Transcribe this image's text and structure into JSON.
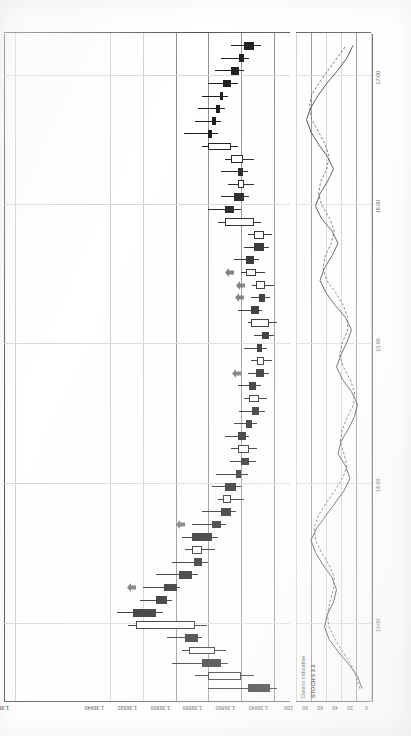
{
  "app": {
    "title": "Forex candlestick chart with stochastic oscillator",
    "notes": {
      "data_disclaimer": "Data is indicative",
      "indicator_label": "STOCH 5 3 3"
    }
  },
  "colors": {
    "bearish_body": "#111111",
    "bullish_body": "#ffffff",
    "outline": "#111111",
    "grid": "#cfcfcf",
    "grid_major": "#8a8a8a",
    "axis": "#555555",
    "signal_arrow": "#6b6b6b",
    "stoch_k": "#222222",
    "stoch_d": "#444444",
    "background": "#ffffff"
  },
  "chart_data": {
    "type": "candlestick",
    "title": "",
    "xlabel": "",
    "ylabel": "",
    "grid": true,
    "legend_position": "none",
    "price_axis": {
      "labels": [
        "1.36998",
        "1.36940",
        "1.36920",
        "1.36900",
        "1.36880",
        "1.36860",
        "1.36840"
      ],
      "values": [
        1.36998,
        1.3694,
        1.3692,
        1.369,
        1.3688,
        1.3686,
        1.3684
      ],
      "ylim": [
        1.3683,
        1.37005
      ]
    },
    "time_axis": {
      "labels": [
        "13:00",
        "14:00",
        "15:00",
        "16:00",
        "17:00"
      ],
      "positions": [
        0.115,
        0.325,
        0.535,
        0.742,
        0.935
      ]
    },
    "candles": [
      {
        "t": "13:00",
        "o": 1.36856,
        "h": 1.3688,
        "l": 1.36838,
        "c": 1.36842,
        "dir": "down"
      },
      {
        "t": "13:05",
        "o": 1.3686,
        "h": 1.36888,
        "l": 1.36852,
        "c": 1.3688,
        "dir": "up"
      },
      {
        "t": "13:10",
        "o": 1.36884,
        "h": 1.36902,
        "l": 1.36868,
        "c": 1.36872,
        "dir": "down"
      },
      {
        "t": "13:15",
        "o": 1.36876,
        "h": 1.36896,
        "l": 1.36869,
        "c": 1.36892,
        "dir": "up"
      },
      {
        "t": "13:20",
        "o": 1.36894,
        "h": 1.36905,
        "l": 1.36884,
        "c": 1.36886,
        "dir": "down"
      },
      {
        "t": "13:25",
        "o": 1.36888,
        "h": 1.36929,
        "l": 1.36881,
        "c": 1.36924,
        "dir": "up"
      },
      {
        "t": "13:30",
        "o": 1.36926,
        "h": 1.36936,
        "l": 1.36908,
        "c": 1.36912,
        "dir": "down"
      },
      {
        "t": "13:35",
        "o": 1.36912,
        "h": 1.36922,
        "l": 1.36902,
        "c": 1.36905,
        "dir": "down"
      },
      {
        "t": "13:40",
        "o": 1.36907,
        "h": 1.3692,
        "l": 1.36897,
        "c": 1.36899,
        "dir": "down",
        "signal": true
      },
      {
        "t": "13:45",
        "o": 1.36898,
        "h": 1.36912,
        "l": 1.36886,
        "c": 1.3689,
        "dir": "down"
      },
      {
        "t": "13:50",
        "o": 1.36889,
        "h": 1.36902,
        "l": 1.3688,
        "c": 1.36884,
        "dir": "down"
      },
      {
        "t": "13:55",
        "o": 1.36884,
        "h": 1.36894,
        "l": 1.36876,
        "c": 1.3689,
        "dir": "up"
      },
      {
        "t": "14:00",
        "o": 1.3689,
        "h": 1.36896,
        "l": 1.36874,
        "c": 1.36878,
        "dir": "down"
      },
      {
        "t": "14:05",
        "o": 1.36878,
        "h": 1.3689,
        "l": 1.36869,
        "c": 1.36872,
        "dir": "down",
        "signal": true
      },
      {
        "t": "14:10",
        "o": 1.36872,
        "h": 1.36884,
        "l": 1.36863,
        "c": 1.36866,
        "dir": "down"
      },
      {
        "t": "14:15",
        "o": 1.36866,
        "h": 1.36874,
        "l": 1.36858,
        "c": 1.36871,
        "dir": "up"
      },
      {
        "t": "14:20",
        "o": 1.3687,
        "h": 1.36878,
        "l": 1.3686,
        "c": 1.36863,
        "dir": "down"
      },
      {
        "t": "14:25",
        "o": 1.36863,
        "h": 1.36875,
        "l": 1.36856,
        "c": 1.3686,
        "dir": "down"
      },
      {
        "t": "14:30",
        "o": 1.3686,
        "h": 1.36867,
        "l": 1.36851,
        "c": 1.36855,
        "dir": "down"
      },
      {
        "t": "14:35",
        "o": 1.36855,
        "h": 1.36866,
        "l": 1.3685,
        "c": 1.36862,
        "dir": "up"
      },
      {
        "t": "14:40",
        "o": 1.36862,
        "h": 1.3687,
        "l": 1.36855,
        "c": 1.36857,
        "dir": "down"
      },
      {
        "t": "14:45",
        "o": 1.36857,
        "h": 1.36864,
        "l": 1.3685,
        "c": 1.36853,
        "dir": "down"
      },
      {
        "t": "14:50",
        "o": 1.36853,
        "h": 1.36861,
        "l": 1.36845,
        "c": 1.36849,
        "dir": "down"
      },
      {
        "t": "14:55",
        "o": 1.36849,
        "h": 1.36858,
        "l": 1.36844,
        "c": 1.36855,
        "dir": "up"
      },
      {
        "t": "15:00",
        "o": 1.36855,
        "h": 1.36862,
        "l": 1.36848,
        "c": 1.36851,
        "dir": "down"
      },
      {
        "t": "15:05",
        "o": 1.36851,
        "h": 1.36856,
        "l": 1.36843,
        "c": 1.36846,
        "dir": "down",
        "signal": true
      },
      {
        "t": "15:10",
        "o": 1.36846,
        "h": 1.36854,
        "l": 1.36841,
        "c": 1.3685,
        "dir": "up"
      },
      {
        "t": "15:15",
        "o": 1.3685,
        "h": 1.36858,
        "l": 1.36844,
        "c": 1.36847,
        "dir": "down"
      },
      {
        "t": "15:20",
        "o": 1.36847,
        "h": 1.36852,
        "l": 1.3684,
        "c": 1.36843,
        "dir": "down"
      },
      {
        "t": "15:25",
        "o": 1.36843,
        "h": 1.36856,
        "l": 1.36838,
        "c": 1.36854,
        "dir": "up"
      },
      {
        "t": "15:30",
        "o": 1.36854,
        "h": 1.36862,
        "l": 1.36847,
        "c": 1.36849,
        "dir": "down"
      },
      {
        "t": "15:35",
        "o": 1.36849,
        "h": 1.36854,
        "l": 1.36842,
        "c": 1.36845,
        "dir": "down",
        "signal": true
      },
      {
        "t": "15:40",
        "o": 1.36845,
        "h": 1.36853,
        "l": 1.3684,
        "c": 1.36851,
        "dir": "up",
        "signal": true
      },
      {
        "t": "15:45",
        "o": 1.36851,
        "h": 1.3686,
        "l": 1.36845,
        "c": 1.36857,
        "dir": "up",
        "signal": true
      },
      {
        "t": "15:50",
        "o": 1.36857,
        "h": 1.36864,
        "l": 1.36849,
        "c": 1.36852,
        "dir": "down"
      },
      {
        "t": "15:55",
        "o": 1.36852,
        "h": 1.36858,
        "l": 1.36843,
        "c": 1.36846,
        "dir": "down"
      },
      {
        "t": "16:00",
        "o": 1.36846,
        "h": 1.36856,
        "l": 1.36841,
        "c": 1.36852,
        "dir": "up"
      },
      {
        "t": "16:05",
        "o": 1.36852,
        "h": 1.36874,
        "l": 1.36848,
        "c": 1.3687,
        "dir": "up"
      },
      {
        "t": "16:10",
        "o": 1.3687,
        "h": 1.3688,
        "l": 1.3686,
        "c": 1.36864,
        "dir": "down"
      },
      {
        "t": "16:15",
        "o": 1.36864,
        "h": 1.36872,
        "l": 1.36855,
        "c": 1.36858,
        "dir": "down"
      },
      {
        "t": "16:20",
        "o": 1.36858,
        "h": 1.36868,
        "l": 1.36852,
        "c": 1.36862,
        "dir": "up"
      },
      {
        "t": "16:25",
        "o": 1.36862,
        "h": 1.36872,
        "l": 1.36856,
        "c": 1.36859,
        "dir": "down"
      },
      {
        "t": "16:30",
        "o": 1.36859,
        "h": 1.3687,
        "l": 1.36852,
        "c": 1.36866,
        "dir": "up"
      },
      {
        "t": "16:35",
        "o": 1.36866,
        "h": 1.36884,
        "l": 1.36862,
        "c": 1.3688,
        "dir": "up"
      },
      {
        "t": "16:40",
        "o": 1.3688,
        "h": 1.36895,
        "l": 1.36874,
        "c": 1.36878,
        "dir": "down"
      },
      {
        "t": "16:45",
        "o": 1.36878,
        "h": 1.36888,
        "l": 1.36872,
        "c": 1.36875,
        "dir": "down"
      },
      {
        "t": "16:50",
        "o": 1.36875,
        "h": 1.36886,
        "l": 1.3687,
        "c": 1.36873,
        "dir": "down"
      },
      {
        "t": "16:55",
        "o": 1.36873,
        "h": 1.36884,
        "l": 1.36868,
        "c": 1.36871,
        "dir": "down"
      },
      {
        "t": "17:00",
        "o": 1.36871,
        "h": 1.3688,
        "l": 1.36862,
        "c": 1.36866,
        "dir": "down"
      },
      {
        "t": "17:05",
        "o": 1.36866,
        "h": 1.36876,
        "l": 1.36858,
        "c": 1.36861,
        "dir": "down"
      },
      {
        "t": "17:10",
        "o": 1.36861,
        "h": 1.36872,
        "l": 1.36855,
        "c": 1.36858,
        "dir": "down"
      },
      {
        "t": "17:15",
        "o": 1.36858,
        "h": 1.36866,
        "l": 1.36848,
        "c": 1.36852,
        "dir": "down"
      }
    ],
    "indicator": {
      "type": "line",
      "name": "STOCH 5 3 3",
      "ylim": [
        0,
        100
      ],
      "yticks": [
        100,
        80,
        60,
        40,
        20,
        0
      ],
      "ytick_labels": [
        "100",
        "80",
        "60",
        "40",
        "20",
        "0"
      ],
      "levels": [
        80,
        20
      ],
      "series": [
        {
          "name": "%K",
          "style": "solid",
          "values": [
            12,
            18,
            30,
            44,
            56,
            62,
            58,
            50,
            46,
            52,
            64,
            74,
            80,
            72,
            60,
            48,
            36,
            28,
            34,
            44,
            40,
            30,
            22,
            18,
            26,
            38,
            46,
            40,
            32,
            26,
            34,
            48,
            60,
            68,
            62,
            52,
            44,
            52,
            66,
            74,
            68,
            58,
            50,
            58,
            70,
            80,
            86,
            80,
            70,
            58,
            44,
            32,
            24
          ]
        },
        {
          "name": "%D",
          "style": "dashed",
          "values": [
            15,
            20,
            27,
            38,
            48,
            56,
            58,
            55,
            50,
            49,
            56,
            66,
            74,
            76,
            70,
            60,
            48,
            38,
            32,
            36,
            41,
            38,
            31,
            23,
            22,
            28,
            37,
            42,
            38,
            31,
            31,
            37,
            47,
            59,
            64,
            61,
            53,
            49,
            55,
            65,
            70,
            67,
            59,
            56,
            61,
            70,
            79,
            82,
            79,
            69,
            57,
            45,
            33
          ]
        }
      ]
    }
  },
  "axis_labels": {
    "price": [
      "1.36998",
      "1.36940",
      "1.36920",
      "1.36900",
      "1.36880",
      "1.36860",
      "1.36840"
    ],
    "time": [
      "13:00",
      "14:00",
      "15:00",
      "16:00",
      "17:00"
    ],
    "stoch": [
      "100",
      "80",
      "60",
      "40",
      "20",
      "0"
    ]
  }
}
